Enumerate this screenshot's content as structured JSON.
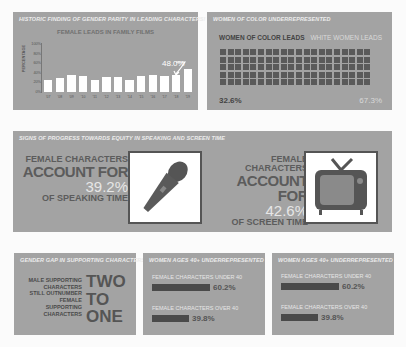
{
  "panel_leads": {
    "title": "HISTORIC FINDING OF GENDER PARITY IN LEADING CHARACTERS!",
    "subtitle": "FEMALE LEADS IN FAMILY FILMS",
    "ylabel": "PERCENTAGE",
    "yticks": [
      "100%",
      "80%",
      "60%",
      "40%",
      "20%",
      "0%"
    ],
    "callout": "48.0%"
  },
  "panel_woc": {
    "title": "WOMEN OF COLOR UNDERREPRESENTED",
    "label_left": "WOMEN OF COLOR LEADS",
    "label_right": "WHITE WOMEN LEADS",
    "pct_left": "32.6%",
    "pct_right": "67.3%",
    "grid_cols": 20,
    "grid_rows": 5
  },
  "panel_progress": {
    "title": "SIGNS OF PROGRESS TOWARDS EQUITY IN SPEAKING AND SCREEN TIME",
    "speaking": {
      "l1": "FEMALE CHARACTERS",
      "l2": "ACCOUNT FOR",
      "value": "39.2%",
      "l4": "OF SPEAKING TIME",
      "icon": "microphone-icon"
    },
    "screen": {
      "l1": "FEMALE CHARACTERS",
      "l2": "ACCOUNT FOR",
      "value": "42.6%",
      "l4": "OF SCREEN TIME",
      "icon": "television-icon"
    }
  },
  "panel_support": {
    "title": "GENDER GAP IN SUPPORTING CHARACTERS",
    "desc_lines": [
      "MALE SUPPORTING",
      "CHARACTERS",
      "STILL OUTNUMBER",
      "FEMALE",
      "SUPPORTING",
      "CHARACTERS"
    ],
    "big_lines": [
      "TWO",
      "TO",
      "ONE"
    ]
  },
  "panel_age_a": {
    "title": "WOMEN AGES 40+ UNDERREPRESENTED",
    "row1_label": "FEMALE CHARACTERS UNDER 40",
    "row1_value": "60.2%",
    "row2_label": "FEMALE CHARACTERS OVER 40",
    "row2_value": "39.8%"
  },
  "panel_age_b": {
    "title": "WOMEN AGES 40+ UNDERREPRESENTED",
    "row1_label": "FEMALE CHARACTERS UNDER 40",
    "row1_value": "60.2%",
    "row2_label": "FEMALE CHARACTERS OVER 40",
    "row2_value": "39.8%"
  },
  "chart_data": [
    {
      "type": "bar",
      "title": "FEMALE LEADS IN FAMILY FILMS",
      "xlabel": "",
      "ylabel": "PERCENTAGE",
      "ylim": [
        0,
        100
      ],
      "categories": [
        "'07",
        "'08",
        "'09",
        "'10",
        "'11",
        "'12",
        "'13",
        "'14",
        "'15",
        "'16",
        "'17",
        "'18",
        "'19"
      ],
      "values": [
        26,
        30,
        35,
        34,
        25,
        31,
        31,
        24,
        34,
        36,
        33,
        36,
        48
      ],
      "annotations": [
        {
          "category": "'19",
          "text": "48.0%"
        }
      ],
      "grid": false
    },
    {
      "type": "waffle",
      "title": "WOMEN OF COLOR UNDERREPRESENTED",
      "categories": [
        "WOMEN OF COLOR LEADS",
        "WHITE WOMEN LEADS"
      ],
      "values": [
        32.6,
        67.3
      ]
    },
    {
      "type": "bar",
      "title": "WOMEN AGES 40+ UNDERREPRESENTED",
      "categories": [
        "FEMALE CHARACTERS UNDER 40",
        "FEMALE CHARACTERS OVER 40"
      ],
      "values": [
        60.2,
        39.8
      ]
    }
  ]
}
